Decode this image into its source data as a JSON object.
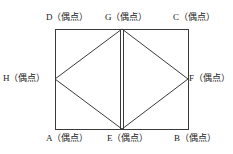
{
  "figure": {
    "stroke_color": "#3a3a3a",
    "background_color": "#ffffff",
    "label_color": "#1a1a1a",
    "annotation": "（偶点）",
    "rectangle": {
      "left": 55,
      "top": 29,
      "right": 188,
      "bottom": 129
    },
    "vertices": [
      {
        "id": "D",
        "label": "D（偶点）",
        "point_letter": "D",
        "x": 55,
        "y": 29,
        "role": "rectangle-top-left"
      },
      {
        "id": "G",
        "label": "G（偶点）",
        "point_letter": "G",
        "x": 122,
        "y": 29,
        "role": "top-midpoint"
      },
      {
        "id": "C",
        "label": "C（偶点）",
        "point_letter": "C",
        "x": 188,
        "y": 29,
        "role": "rectangle-top-right"
      },
      {
        "id": "H",
        "label": "H（偶点）",
        "point_letter": "H",
        "x": 55,
        "y": 79,
        "role": "left-midpoint"
      },
      {
        "id": "F",
        "label": "F（偶点）",
        "point_letter": "F",
        "x": 188,
        "y": 79,
        "role": "right-midpoint"
      },
      {
        "id": "A",
        "label": "A（偶点）",
        "point_letter": "A",
        "x": 55,
        "y": 129,
        "role": "rectangle-bottom-left"
      },
      {
        "id": "E",
        "label": "E（偶点）",
        "point_letter": "E",
        "x": 122,
        "y": 129,
        "role": "bottom-midpoint"
      },
      {
        "id": "B",
        "label": "B（偶点）",
        "point_letter": "B",
        "x": 188,
        "y": 129,
        "role": "rectangle-bottom-right"
      }
    ],
    "edges": [
      {
        "id": "DC",
        "from": "D",
        "to": "C",
        "style": "single"
      },
      {
        "id": "CB",
        "from": "C",
        "to": "B",
        "style": "single"
      },
      {
        "id": "BA",
        "from": "B",
        "to": "A",
        "style": "single"
      },
      {
        "id": "AD",
        "from": "A",
        "to": "D",
        "style": "single"
      },
      {
        "id": "HG",
        "from": "H",
        "to": "G",
        "style": "single"
      },
      {
        "id": "GF",
        "from": "G",
        "to": "F",
        "style": "single"
      },
      {
        "id": "FE",
        "from": "F",
        "to": "E",
        "style": "single"
      },
      {
        "id": "EH",
        "from": "E",
        "to": "H",
        "style": "single"
      },
      {
        "id": "GE",
        "from": "G",
        "to": "E",
        "style": "double"
      }
    ]
  }
}
